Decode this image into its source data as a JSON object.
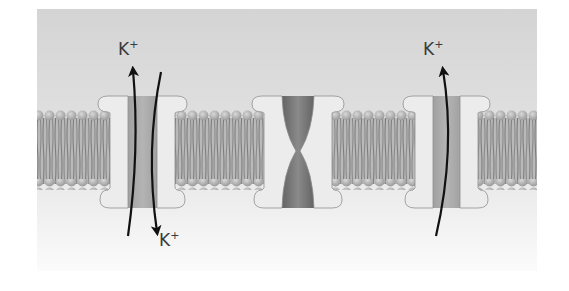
{
  "diagram": {
    "colors": {
      "background_top": "#d6d6d6",
      "background_bottom": "#f7f7f7",
      "lipid_head": "#b3b3b3",
      "lipid_tail": "#9e9e9e",
      "protein_light": "#ececec",
      "protein_channel": "#a3a3a3",
      "closed_channel_core": "#6e6e6e",
      "arrow": "#111111",
      "label": "#3a3a3a"
    },
    "channels": [
      {
        "id": "left",
        "state": "open",
        "labels": [
          {
            "ion": "K",
            "charge": "+",
            "position": "top"
          },
          {
            "ion": "K",
            "charge": "+",
            "position": "bottom"
          }
        ],
        "arrows": [
          "outward (up)",
          "inward (down)"
        ]
      },
      {
        "id": "middle",
        "state": "closed",
        "labels": [],
        "arrows": []
      },
      {
        "id": "right",
        "state": "open",
        "labels": [
          {
            "ion": "K",
            "charge": "+",
            "position": "top"
          }
        ],
        "arrows": [
          "outward (up)"
        ]
      }
    ]
  }
}
